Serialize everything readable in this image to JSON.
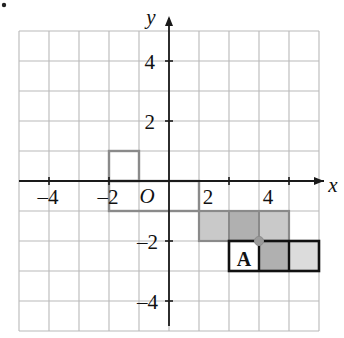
{
  "figure": {
    "type": "coordinate-grid",
    "corner_mark": "•",
    "axes": {
      "x_label": "x",
      "y_label": "y",
      "origin_label": "O",
      "x_ticks": [
        {
          "value": -4,
          "label": "–4",
          "px": 48
        },
        {
          "value": -2,
          "label": "–2",
          "px": 108
        },
        {
          "value": 2,
          "label": "2",
          "px": 208
        },
        {
          "value": 4,
          "label": "4",
          "px": 268
        }
      ],
      "y_ticks": [
        {
          "value": 4,
          "label": "4",
          "px": 62
        },
        {
          "value": 2,
          "label": "2",
          "px": 122
        },
        {
          "value": -2,
          "label": "–2",
          "px": 242
        },
        {
          "value": -4,
          "label": "–4",
          "px": 302
        }
      ]
    },
    "grid": {
      "cell_size_px": 30,
      "left_px": 19,
      "top_px": 31,
      "cols": 10,
      "rows": 10,
      "x_min": -5,
      "x_max": 5,
      "y_min": -5,
      "y_max": 5,
      "line_color": "#b9b9b9"
    },
    "colors": {
      "grid_line": "#b9b9b9",
      "axis": "#1a1a1a",
      "outline_gray": "#8a8a8a",
      "outline_black": "#111111",
      "shade_light": "#c9c9c9",
      "shade_mid": "#b0b0b0",
      "shade_pale": "#dcdcdc",
      "pivot": "#9a9a9a",
      "text": "#111111"
    },
    "preimage": {
      "name": "outlined-preimage",
      "outline_cells": [
        {
          "x0": -2,
          "y0": 0,
          "x1": -1,
          "y1": 1
        },
        {
          "x0": -2,
          "y0": -1,
          "x1": 1,
          "y1": 0
        }
      ]
    },
    "image_shape": {
      "name": "shaded-image",
      "upper_strip": {
        "x0": 1,
        "y0": -2,
        "x1": 4,
        "y1": -1,
        "fill": "#c9c9c9"
      },
      "upper_dark_cell": {
        "x0": 2,
        "y0": -2,
        "x1": 3,
        "y1": -1,
        "fill": "#b0b0b0"
      },
      "lower_strip": {
        "x0": 2,
        "y0": -3,
        "x1": 5,
        "y1": -2
      },
      "lower_cells": [
        {
          "x0": 2,
          "y0": -3,
          "x1": 3,
          "y1": -2,
          "fill": "#ffffff"
        },
        {
          "x0": 3,
          "y0": -3,
          "x1": 4,
          "y1": -2,
          "fill": "#b0b0b0"
        },
        {
          "x0": 4,
          "y0": -3,
          "x1": 5,
          "y1": -2,
          "fill": "#dcdcdc"
        }
      ]
    },
    "pivot_point": {
      "x": 3,
      "y": -2,
      "label": ""
    },
    "shape_label": {
      "text": "A",
      "x": 2.5,
      "y": -2.55
    }
  }
}
